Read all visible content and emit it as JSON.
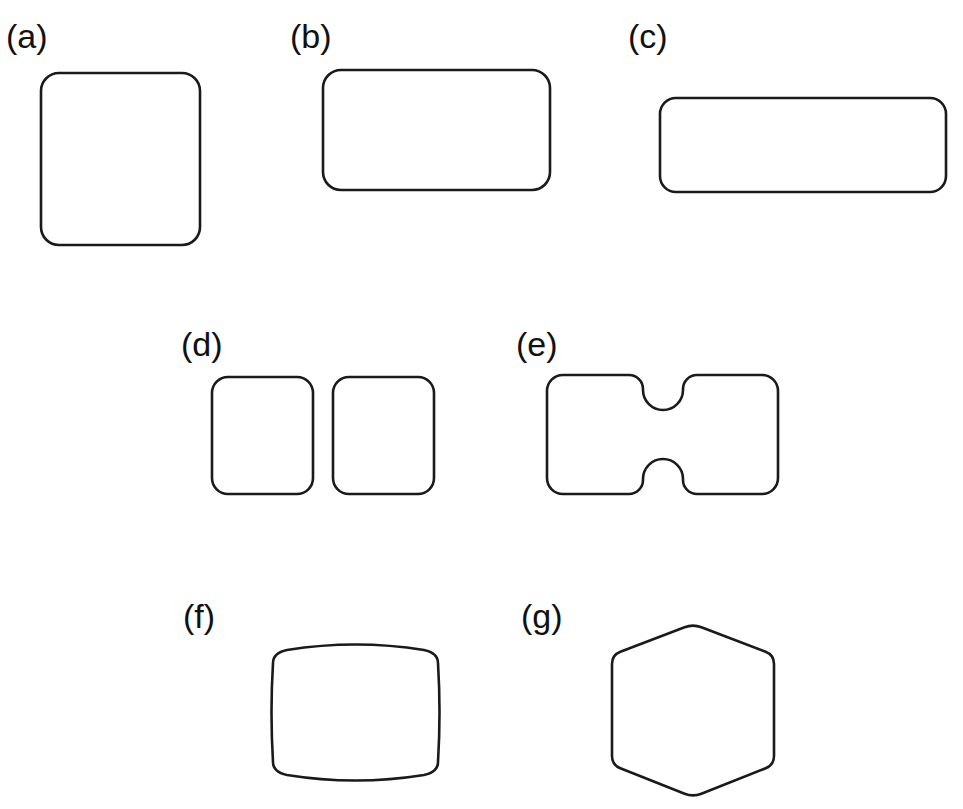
{
  "figure": {
    "background_color": "#ffffff",
    "stroke_color": "#1a1a1a",
    "fill_color": "#ffffff",
    "stroke_width": 2.6,
    "canvas": {
      "width": 963,
      "height": 809
    }
  },
  "panels": [
    {
      "id": "a",
      "label": "(a)",
      "shape_name": "rounded-square",
      "label_x": 6,
      "label_y": 48,
      "bounds": {
        "x": 41,
        "y": 73,
        "width": 159,
        "height": 172
      },
      "corner_radius": 18
    },
    {
      "id": "b",
      "label": "(b)",
      "shape_name": "rounded-rectangle-wide",
      "label_x": 290,
      "label_y": 48,
      "bounds": {
        "x": 323,
        "y": 70,
        "width": 227,
        "height": 120
      },
      "corner_radius": 18
    },
    {
      "id": "c",
      "label": "(c)",
      "shape_name": "rounded-rectangle-wider",
      "label_x": 628,
      "label_y": 48,
      "bounds": {
        "x": 660,
        "y": 98,
        "width": 286,
        "height": 94
      },
      "corner_radius": 16
    },
    {
      "id": "d",
      "label": "(d)",
      "shape_name": "two-separated-rounded-rectangles",
      "label_x": 181,
      "label_y": 356,
      "left_bounds": {
        "x": 212,
        "y": 377,
        "width": 101,
        "height": 117
      },
      "right_bounds": {
        "x": 333,
        "y": 377,
        "width": 101,
        "height": 117
      },
      "corner_radius": 16
    },
    {
      "id": "e",
      "label": "(e)",
      "shape_name": "notched-rectangle",
      "label_x": 516,
      "label_y": 356,
      "bounds": {
        "x": 547,
        "y": 375,
        "width": 231,
        "height": 119
      },
      "corner_radius": 16,
      "notch_center_x": 663,
      "notch_half_width": 20,
      "notch_depth": 35
    },
    {
      "id": "f",
      "label": "(f)",
      "shape_name": "barrel-pillow-shape",
      "label_x": 183,
      "label_y": 628,
      "bounds": {
        "x": 273,
        "y": 641,
        "width": 165,
        "height": 143
      },
      "side_inset_y": 12,
      "arc_bulge": 12
    },
    {
      "id": "g",
      "label": "(g)",
      "shape_name": "hexagon",
      "label_x": 521,
      "label_y": 628,
      "center": {
        "x": 693,
        "y": 710
      },
      "vertices": [
        {
          "x": 693,
          "y": 624
        },
        {
          "x": 774,
          "y": 655
        },
        {
          "x": 774,
          "y": 765
        },
        {
          "x": 693,
          "y": 797
        },
        {
          "x": 612,
          "y": 765
        },
        {
          "x": 612,
          "y": 655
        }
      ],
      "corner_radius": 9
    }
  ]
}
